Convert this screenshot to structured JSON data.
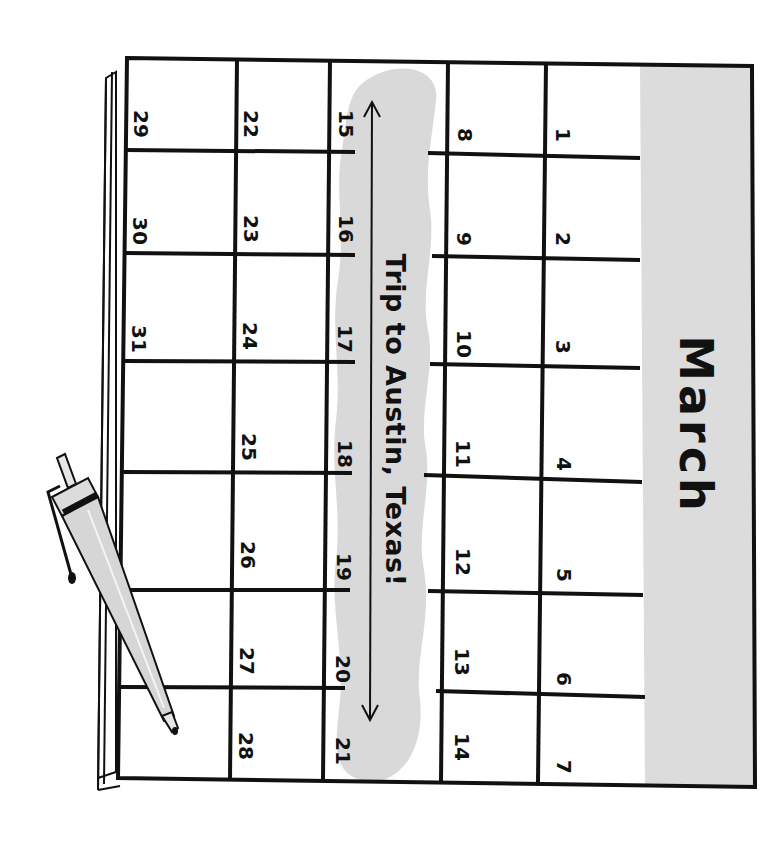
{
  "calendar": {
    "month": "March",
    "orientation": "rotated 90° clockwise",
    "days": [
      {
        "week": 1,
        "days": [
          "1",
          "2",
          "3",
          "4",
          "5",
          "6",
          "7"
        ]
      },
      {
        "week": 2,
        "days": [
          "8",
          "9",
          "10",
          "11",
          "12",
          "13",
          "14"
        ]
      },
      {
        "week": 3,
        "days": [
          "15",
          "16",
          "17",
          "18",
          "19",
          "20",
          "21"
        ]
      },
      {
        "week": 4,
        "days": [
          "22",
          "23",
          "24",
          "25",
          "26",
          "27",
          "28"
        ]
      },
      {
        "week": 5,
        "days": [
          "29",
          "30",
          "31",
          "",
          "",
          "",
          ""
        ]
      }
    ],
    "d": {
      "d1": "1",
      "d2": "2",
      "d3": "3",
      "d4": "4",
      "d5": "5",
      "d6": "6",
      "d7": "7",
      "d8": "8",
      "d9": "9",
      "d10": "10",
      "d11": "11",
      "d12": "12",
      "d13": "13",
      "d14": "14",
      "d15": "15",
      "d16": "16",
      "d17": "17",
      "d18": "18",
      "d19": "19",
      "d20": "20",
      "d21": "21",
      "d22": "22",
      "d23": "23",
      "d24": "24",
      "d25": "25",
      "d26": "26",
      "d27": "27",
      "d28": "28",
      "d29": "29",
      "d30": "30",
      "d31": "31"
    }
  },
  "event": {
    "label": "Trip to Austin, Texas!",
    "span_start": "15",
    "span_end": "21"
  },
  "colors": {
    "ink": "#111111",
    "highlight": "#d9d9d9",
    "header_fill": "#dcdcdc",
    "paper": "#ffffff",
    "pen_body": "#d6d6d6"
  },
  "decorations": {
    "pen": "pen-icon",
    "arrow": "double-arrow-icon"
  }
}
